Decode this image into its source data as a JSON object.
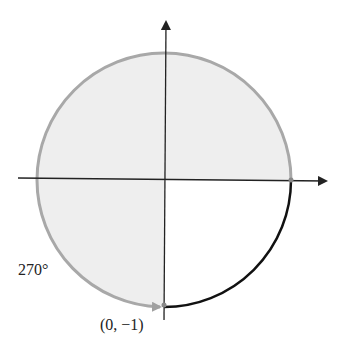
{
  "diagram": {
    "type": "unit-circle-angle",
    "angle_label": "270°",
    "point_label": "(0, −1)",
    "colors": {
      "disk_fill": "#eeeeee",
      "circle_stroke": "#a8a8a8",
      "axis": "#222222",
      "highlight_arc": "#111111",
      "angle_arrow": "#a0a0a0"
    }
  }
}
